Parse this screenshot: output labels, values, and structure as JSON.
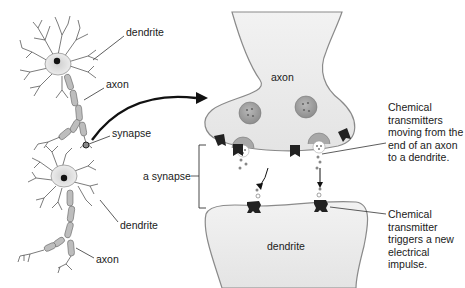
{
  "diagram": {
    "type": "labeled anatomical illustration",
    "palette": {
      "background": "#ffffff",
      "cell_fill": "#ececec",
      "cell_edge": "#9a9a9a",
      "soma_fill": "#dcdcdc",
      "nucleus": "#111111",
      "myelin": "#b5b5b5",
      "vesicle_fill": "#9e9e9e",
      "receptor": "#222222",
      "label_text": "#1a1a1a"
    },
    "left_panel": {
      "labels": {
        "dendrite_top": "dendrite",
        "axon_top": "axon",
        "synapse": "synapse",
        "dendrite_bottom": "dendrite",
        "axon_bottom": "axon"
      }
    },
    "right_panel": {
      "axon_terminal_label": "axon",
      "dendrite_label": "dendrite",
      "synapse_bracket_label": "a synapse",
      "annotation_top": "Chemical transmitters moving from the end of an axon to a dendrite.",
      "annotation_bottom": "Chemical transmitter triggers a new electrical impulse."
    }
  }
}
